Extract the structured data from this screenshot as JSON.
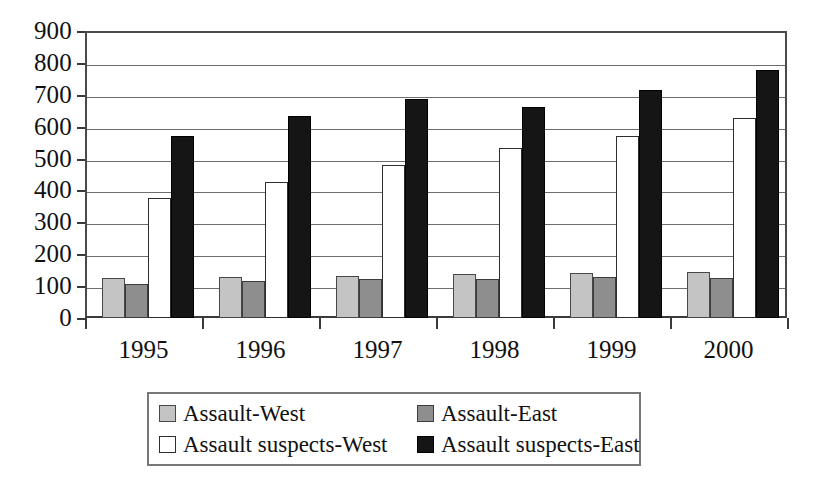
{
  "chart_data": {
    "type": "bar",
    "title": "",
    "subtitle": "",
    "xlabel": "",
    "ylabel": "",
    "categories": [
      "1995",
      "1996",
      "1997",
      "1998",
      "1999",
      "2000"
    ],
    "series": [
      {
        "name": "Assault-West",
        "color": "#c4c4c4",
        "values": [
          125,
          128,
          132,
          137,
          141,
          143
        ]
      },
      {
        "name": "Assault-East",
        "color": "#8e8e8e",
        "values": [
          107,
          115,
          122,
          123,
          130,
          127
        ]
      },
      {
        "name": "Assault suspects-West",
        "color": "#ffffff",
        "values": [
          375,
          425,
          480,
          532,
          572,
          627
        ]
      },
      {
        "name": "Assault suspects-East",
        "color": "#151515",
        "values": [
          570,
          633,
          688,
          661,
          715,
          777
        ]
      }
    ],
    "ylim": [
      0,
      900
    ],
    "ytick_step": 100,
    "yticks": [
      "900",
      "800",
      "700",
      "600",
      "500",
      "400",
      "300",
      "200",
      "100",
      "0"
    ],
    "grid": true,
    "legend_position": "bottom",
    "legend_entries": [
      "Assault-West",
      "Assault-East",
      "Assault suspects-West",
      "Assault suspects-East"
    ]
  }
}
